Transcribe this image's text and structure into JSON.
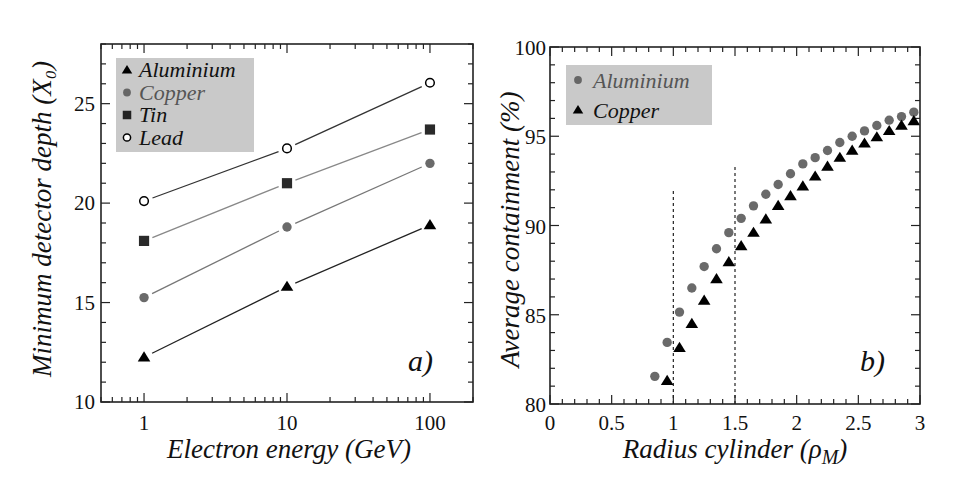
{
  "figure": {
    "panels": [
      {
        "id": "a",
        "panel_label": "a)",
        "xlabel": "Electron energy (GeV)",
        "ylabel": "Minimum detector depth (X₀)",
        "x_ticks": [
          "1",
          "10",
          "100"
        ],
        "y_ticks": [
          "10",
          "15",
          "20",
          "25"
        ],
        "legend": [
          {
            "label": "Aluminium",
            "marker": "triangle",
            "color": "#000000",
            "text_color": "#111111"
          },
          {
            "label": "Copper",
            "marker": "circle",
            "color": "#666666",
            "text_color": "#555555"
          },
          {
            "label": "Tin",
            "marker": "square",
            "color": "#222222",
            "text_color": "#111111"
          },
          {
            "label": "Lead",
            "marker": "open-circle",
            "color": "#000000",
            "text_color": "#111111"
          }
        ]
      },
      {
        "id": "b",
        "panel_label": "b)",
        "xlabel": "Radius cylinder (ρM)",
        "ylabel": "Average containment (%)",
        "x_ticks": [
          "0",
          "0.5",
          "1",
          "1.5",
          "2",
          "2.5",
          "3"
        ],
        "y_ticks": [
          "80",
          "85",
          "90",
          "95",
          "100"
        ],
        "legend": [
          {
            "label": "Aluminium",
            "marker": "circle",
            "color": "#666666",
            "text_color": "#555555"
          },
          {
            "label": "Copper",
            "marker": "triangle",
            "color": "#000000",
            "text_color": "#111111"
          }
        ]
      }
    ],
    "colors": {
      "legend_bg": "#c9c9c9",
      "axis": "#222222",
      "line": "#333333",
      "gray_marker": "#6a6a6a"
    }
  },
  "chart_data": [
    {
      "type": "line",
      "title": "a)",
      "xlabel": "Electron energy (GeV)",
      "ylabel": "Minimum detector depth (X0)",
      "xscale": "log",
      "xlim": [
        0.5,
        200
      ],
      "ylim": [
        10,
        28
      ],
      "x_ticks": [
        1,
        10,
        100
      ],
      "y_ticks": [
        10,
        15,
        20,
        25
      ],
      "legend_position": "upper left",
      "grid": false,
      "x": [
        1,
        10,
        100
      ],
      "series": [
        {
          "name": "Aluminium",
          "marker": "filled triangle",
          "values": [
            12.25,
            15.8,
            18.9
          ]
        },
        {
          "name": "Copper",
          "marker": "filled gray circle",
          "values": [
            15.25,
            18.8,
            22.0
          ]
        },
        {
          "name": "Tin",
          "marker": "filled square",
          "values": [
            18.1,
            21.0,
            23.7
          ]
        },
        {
          "name": "Lead",
          "marker": "open circle",
          "values": [
            20.1,
            22.75,
            26.05
          ]
        }
      ]
    },
    {
      "type": "scatter",
      "title": "b)",
      "xlabel": "Radius cylinder (ρM)",
      "ylabel": "Average containment (%)",
      "xlim": [
        0,
        3
      ],
      "ylim": [
        80,
        100
      ],
      "x_ticks": [
        0,
        0.5,
        1,
        1.5,
        2,
        2.5,
        3
      ],
      "y_ticks": [
        80,
        85,
        90,
        95,
        100
      ],
      "legend_position": "upper left",
      "grid": false,
      "series": [
        {
          "name": "Aluminium",
          "marker": "filled gray circle",
          "x": [
            0.85,
            0.95,
            1.05,
            1.15,
            1.25,
            1.35,
            1.45,
            1.55,
            1.65,
            1.75,
            1.85,
            1.95,
            2.05,
            2.15,
            2.25,
            2.35,
            2.45,
            2.55,
            2.65,
            2.75,
            2.85,
            2.95
          ],
          "values": [
            81.55,
            83.45,
            85.15,
            86.5,
            87.7,
            88.7,
            89.6,
            90.4,
            91.1,
            91.75,
            92.3,
            92.9,
            93.45,
            93.8,
            94.2,
            94.65,
            95.0,
            95.3,
            95.6,
            95.9,
            96.1,
            96.35
          ]
        },
        {
          "name": "Copper",
          "marker": "filled triangle",
          "x": [
            0.95,
            1.05,
            1.15,
            1.25,
            1.35,
            1.45,
            1.55,
            1.65,
            1.75,
            1.85,
            1.95,
            2.05,
            2.15,
            2.25,
            2.35,
            2.45,
            2.55,
            2.65,
            2.75,
            2.85,
            2.95
          ],
          "values": [
            81.3,
            83.15,
            84.5,
            85.8,
            87.0,
            87.95,
            88.85,
            89.6,
            90.35,
            91.1,
            91.65,
            92.2,
            92.75,
            93.3,
            93.8,
            94.2,
            94.6,
            94.95,
            95.3,
            95.6,
            95.85
          ]
        }
      ],
      "annotations": [
        {
          "type": "vertical dashed line",
          "x": 1.0,
          "y_from": 80,
          "y_to": 92.1
        },
        {
          "type": "vertical dashed line",
          "x": 1.5,
          "y_from": 80,
          "y_to": 93.3
        }
      ]
    }
  ]
}
